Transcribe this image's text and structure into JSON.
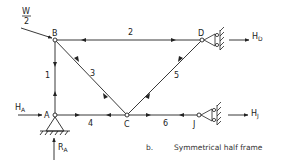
{
  "figure": {
    "panel_label": "b.",
    "caption": "Symmetrical half frame"
  },
  "load": {
    "numerator": "W",
    "denominator": "2"
  },
  "nodes": {
    "A": "A",
    "B": "B",
    "C": "C",
    "D": "D",
    "J": "J"
  },
  "members": {
    "m1": "1",
    "m2": "2",
    "m3": "3",
    "m4": "4",
    "m5": "5",
    "m6": "6"
  },
  "reactions": {
    "HA": {
      "main": "H",
      "sub": "A"
    },
    "RA": {
      "main": "R",
      "sub": "A"
    },
    "HD": {
      "main": "H",
      "sub": "D"
    },
    "HJ": {
      "main": "H",
      "sub": "J"
    }
  },
  "colors": {
    "line": "#222222",
    "background": "#ffffff"
  }
}
